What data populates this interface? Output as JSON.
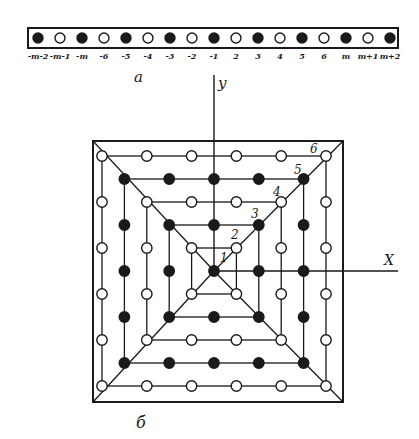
{
  "figure": {
    "part_a": {
      "label": "a",
      "strip": {
        "labels": [
          "-m-2",
          "-m-1",
          "-m",
          "-6",
          "-5",
          "-4",
          "-3",
          "-2",
          "-1",
          "2",
          "3",
          "4",
          "5",
          "6",
          "m",
          "m+1",
          "m+2"
        ],
        "fills": [
          1,
          0,
          1,
          0,
          1,
          0,
          1,
          0,
          1,
          0,
          1,
          0,
          1,
          0,
          1,
          0,
          1
        ]
      }
    },
    "part_b": {
      "label": "б",
      "axes": {
        "x_label": "X",
        "y_label": "y"
      },
      "ring_labels": [
        "1",
        "2",
        "3",
        "4",
        "5",
        "6"
      ],
      "rings": [
        {
          "index": 1,
          "radius": 0,
          "filled": true
        },
        {
          "index": 2,
          "radius": 1,
          "filled": false
        },
        {
          "index": 3,
          "radius": 2,
          "filled": true
        },
        {
          "index": 4,
          "radius": 3,
          "filled": false
        },
        {
          "index": 5,
          "radius": 4,
          "filled": true
        },
        {
          "index": 6,
          "radius": 5,
          "filled": false
        }
      ]
    },
    "colors": {
      "ink": "#1a1a1a",
      "paper": "#ffffff"
    }
  }
}
